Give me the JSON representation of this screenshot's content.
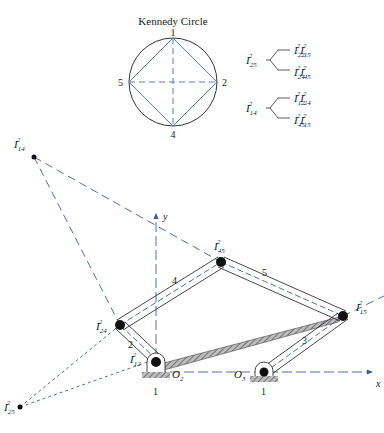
{
  "kennedy_circle": {
    "title": "Kennedy Circle",
    "points": [
      "1",
      "2",
      "4",
      "5"
    ]
  },
  "derivations": [
    {
      "target": "I",
      "target_sub": "25",
      "target_sup": "2",
      "paths": [
        {
          "a_sub": "22",
          "b_sub": "15"
        },
        {
          "a_sub": "24",
          "b_sub": "45"
        }
      ]
    },
    {
      "target": "I",
      "target_sub": "14",
      "target_sup": "2",
      "paths": [
        {
          "a_sub": "12",
          "b_sub": "24"
        },
        {
          "a_sub": "45",
          "b_sub": "15"
        }
      ]
    }
  ],
  "centers": {
    "I14": {
      "main": "I",
      "sub": "14",
      "sup": "2"
    },
    "I24": {
      "main": "I",
      "sub": "24",
      "sup": "2"
    },
    "I12": {
      "main": "I",
      "sub": "12",
      "sup": "2"
    },
    "I45": {
      "main": "I",
      "sub": "45",
      "sup": "2"
    },
    "I15": {
      "main": "I",
      "sub": "15",
      "sup": "2"
    },
    "I25": {
      "main": "I",
      "sub": "25",
      "sup": "2"
    }
  },
  "links": {
    "l2": "2",
    "l3": "3",
    "l4": "4",
    "l5": "5",
    "ground_a": "1",
    "ground_b": "1"
  },
  "pivots": {
    "o2_main": "O",
    "o2_sub": "2",
    "o3_main": "O",
    "o3_sub": "3"
  },
  "axes": {
    "x": "x",
    "y": "y"
  },
  "colors": {
    "construction": "#3b5fa0",
    "link": "#333333",
    "circle": "#333333",
    "ground": "#888888"
  }
}
